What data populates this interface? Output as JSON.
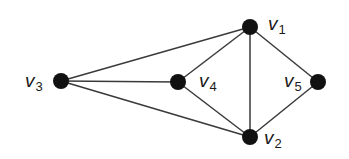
{
  "diagram": {
    "type": "undirected-graph",
    "node_color": "#111111",
    "edge_color": "#3a3a3a",
    "nodes": [
      {
        "id": "v1",
        "letter": "v",
        "index": "1",
        "x": 250,
        "y": 27,
        "label_x": 268,
        "label_y": 14
      },
      {
        "id": "v2",
        "letter": "v",
        "index": "2",
        "x": 250,
        "y": 137,
        "label_x": 264,
        "label_y": 128
      },
      {
        "id": "v3",
        "letter": "v",
        "index": "3",
        "x": 61,
        "y": 81,
        "label_x": 25,
        "label_y": 71
      },
      {
        "id": "v4",
        "letter": "v",
        "index": "4",
        "x": 178,
        "y": 82,
        "label_x": 199,
        "label_y": 71
      },
      {
        "id": "v5",
        "letter": "v",
        "index": "5",
        "x": 318,
        "y": 82,
        "label_x": 284,
        "label_y": 71
      }
    ],
    "edges": [
      [
        "v1",
        "v2"
      ],
      [
        "v1",
        "v3"
      ],
      [
        "v1",
        "v4"
      ],
      [
        "v1",
        "v5"
      ],
      [
        "v2",
        "v3"
      ],
      [
        "v2",
        "v4"
      ],
      [
        "v2",
        "v5"
      ],
      [
        "v3",
        "v4"
      ]
    ]
  }
}
